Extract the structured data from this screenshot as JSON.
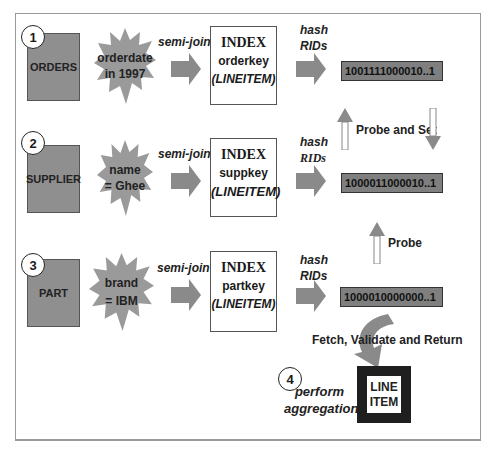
{
  "rows": [
    {
      "step": "1",
      "table": "ORDERS",
      "predicate_line1": "orderdate",
      "predicate_line2": "in 1997",
      "join_label": "semi-join",
      "index_title": "INDEX",
      "index_key": "orderkey",
      "index_table": "(LINEITEM)",
      "hash_line1": "hash",
      "hash_line2": "RIDs",
      "bitmap": "1001111000010..1"
    },
    {
      "step": "2",
      "table": "SUPPLIER",
      "predicate_line1": "name",
      "predicate_line2": "= Ghee",
      "join_label": "semi-join",
      "index_title": "INDEX",
      "index_key": "suppkey",
      "index_table": "(LINEITEM)",
      "hash_line1": "hash",
      "hash_line2": "RIDs",
      "bitmap": "1000011000010..1"
    },
    {
      "step": "3",
      "table": "PART",
      "predicate_line1": "brand",
      "predicate_line2": "= IBM",
      "join_label": "semi-join",
      "index_title": "INDEX",
      "index_key": "partkey",
      "index_table": "(LINEITEM)",
      "hash_line1": "hash",
      "hash_line2": "RIDs",
      "bitmap": "1000010000000..1"
    }
  ],
  "labels": {
    "probe_and_set": "Probe and Set",
    "probe": "Probe",
    "fetch": "Fetch, Validate and Return"
  },
  "final": {
    "step": "4",
    "action_line1": "perform",
    "action_line2": "aggregation",
    "table_line1": "LINE",
    "table_line2": "ITEM"
  },
  "colors": {
    "table_fill": "#8f8f8f",
    "arrow_fill": "#8a8a8a",
    "bitmap_fill": "#7f7f7f",
    "lineitem_border": "#1f1f1f"
  }
}
